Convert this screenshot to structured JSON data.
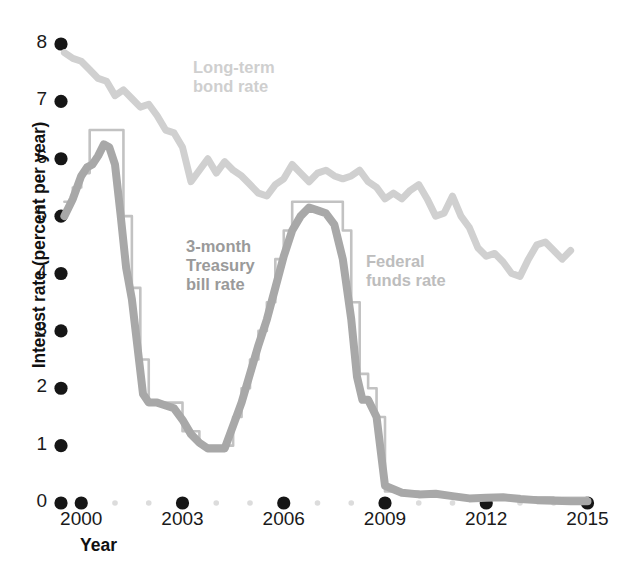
{
  "chart_data": {
    "type": "line",
    "title": "",
    "xlabel": "Year",
    "ylabel": "Interest rate (percent per year)",
    "xlim": [
      1999.4,
      2015.4
    ],
    "ylim": [
      0,
      8
    ],
    "grid": false,
    "legend_position": "inline-annotations",
    "y_ticks": [
      "8",
      "7",
      "6",
      "5",
      "4",
      "3",
      "2",
      "1",
      "0"
    ],
    "y_tick_values": [
      8,
      7,
      6,
      5,
      4,
      3,
      2,
      1,
      0
    ],
    "x_ticks": [
      "2000",
      "2003",
      "2006",
      "2009",
      "2012",
      "2015"
    ],
    "x_tick_values": [
      2000,
      2003,
      2006,
      2009,
      2012,
      2015
    ],
    "x_minor_values": [
      2001,
      2002,
      2004,
      2005,
      2007,
      2008,
      2010,
      2011,
      2013,
      2014
    ],
    "series": [
      {
        "name": "Long-term bond rate",
        "color": "#d0d0d0",
        "width": 7,
        "x": [
          1999.5,
          1999.75,
          2000.0,
          2000.25,
          2000.5,
          2000.75,
          2001.0,
          2001.25,
          2001.5,
          2001.75,
          2002.0,
          2002.25,
          2002.5,
          2002.75,
          2003.0,
          2003.25,
          2003.5,
          2003.75,
          2004.0,
          2004.25,
          2004.5,
          2004.75,
          2005.0,
          2005.25,
          2005.5,
          2005.75,
          2006.0,
          2006.25,
          2006.5,
          2006.75,
          2007.0,
          2007.25,
          2007.5,
          2007.75,
          2008.0,
          2008.25,
          2008.5,
          2008.75,
          2009.0,
          2009.25,
          2009.5,
          2009.75,
          2010.0,
          2010.25,
          2010.5,
          2010.75,
          2011.0,
          2011.25,
          2011.5,
          2011.75,
          2012.0,
          2012.25,
          2012.5,
          2012.75,
          2013.0,
          2013.25,
          2013.5,
          2013.75,
          2014.0,
          2014.25,
          2014.5
        ],
        "y": [
          7.85,
          7.75,
          7.7,
          7.55,
          7.4,
          7.35,
          7.1,
          7.2,
          7.05,
          6.9,
          6.95,
          6.75,
          6.5,
          6.45,
          6.2,
          5.6,
          5.8,
          6.0,
          5.75,
          5.95,
          5.8,
          5.7,
          5.55,
          5.4,
          5.35,
          5.55,
          5.65,
          5.9,
          5.75,
          5.6,
          5.75,
          5.8,
          5.7,
          5.65,
          5.7,
          5.8,
          5.6,
          5.5,
          5.3,
          5.4,
          5.3,
          5.45,
          5.55,
          5.3,
          5.0,
          5.05,
          5.35,
          5.0,
          4.8,
          4.45,
          4.3,
          4.35,
          4.2,
          4.0,
          3.95,
          4.25,
          4.5,
          4.55,
          4.4,
          4.25,
          4.4
        ]
      },
      {
        "name": "3-month Treasury bill rate",
        "color": "#a8a8a8",
        "width": 8,
        "x": [
          1999.5,
          1999.75,
          2000.0,
          2000.17,
          2000.33,
          2000.5,
          2000.67,
          2000.83,
          2001.0,
          2001.17,
          2001.33,
          2001.5,
          2001.67,
          2001.83,
          2002.0,
          2002.25,
          2002.5,
          2002.75,
          2003.0,
          2003.25,
          2003.5,
          2003.75,
          2004.0,
          2004.25,
          2004.5,
          2004.75,
          2005.0,
          2005.25,
          2005.5,
          2005.75,
          2006.0,
          2006.25,
          2006.5,
          2006.75,
          2007.0,
          2007.25,
          2007.5,
          2007.75,
          2008.0,
          2008.17,
          2008.33,
          2008.5,
          2008.75,
          2009.0,
          2009.5,
          2010.0,
          2010.5,
          2011.0,
          2011.5,
          2012.0,
          2012.5,
          2013.0,
          2013.5,
          2014.0,
          2014.5,
          2015.0
        ],
        "y": [
          5.0,
          5.3,
          5.7,
          5.85,
          5.9,
          6.05,
          6.25,
          6.2,
          5.9,
          5.0,
          4.1,
          3.55,
          2.7,
          1.9,
          1.75,
          1.75,
          1.7,
          1.65,
          1.45,
          1.2,
          1.05,
          0.95,
          0.95,
          0.95,
          1.35,
          1.75,
          2.25,
          2.75,
          3.2,
          3.75,
          4.3,
          4.75,
          5.0,
          5.15,
          5.1,
          5.05,
          4.85,
          4.25,
          3.2,
          2.2,
          1.8,
          1.8,
          1.5,
          0.3,
          0.18,
          0.15,
          0.16,
          0.12,
          0.08,
          0.09,
          0.1,
          0.07,
          0.05,
          0.04,
          0.03,
          0.03
        ]
      },
      {
        "name": "Federal funds rate",
        "color": "#c2c2c2",
        "width": 2.6,
        "style": "step",
        "x": [
          1999.5,
          1999.75,
          2000.0,
          2000.25,
          2000.5,
          2001.0,
          2001.25,
          2001.5,
          2001.75,
          2002.0,
          2002.75,
          2003.0,
          2003.5,
          2004.0,
          2004.5,
          2004.75,
          2005.0,
          2005.25,
          2005.5,
          2005.75,
          2006.0,
          2006.25,
          2006.5,
          2007.0,
          2007.5,
          2007.75,
          2008.0,
          2008.25,
          2008.5,
          2008.75,
          2009.0,
          2010.0,
          2011.0,
          2012.0,
          2013.0,
          2014.0,
          2015.0
        ],
        "y": [
          5.25,
          5.5,
          5.75,
          6.5,
          6.5,
          6.5,
          5.0,
          3.75,
          2.5,
          1.75,
          1.75,
          1.25,
          1.0,
          1.0,
          1.5,
          2.0,
          2.5,
          3.0,
          3.5,
          4.25,
          4.75,
          5.25,
          5.25,
          5.25,
          5.25,
          4.75,
          3.5,
          2.25,
          2.0,
          1.5,
          0.2,
          0.15,
          0.1,
          0.12,
          0.1,
          0.09,
          0.1
        ]
      }
    ]
  },
  "annotations": {
    "longterm": "Long-term\nbond rate",
    "tbill": "3-month\nTreasury\nbill rate",
    "fedfunds": "Federal\nfunds rate"
  },
  "axes": {
    "y_title": "Interest rate (percent per year)",
    "x_title": "Year"
  },
  "colors": {
    "long_term_bond": "#d0d0d0",
    "treasury_bill": "#a8a8a8",
    "federal_funds": "#c2c2c2",
    "tick_dot_major": "#161616",
    "tick_dot_minor": "#dcdcdc",
    "text": "#1a1a1a"
  }
}
